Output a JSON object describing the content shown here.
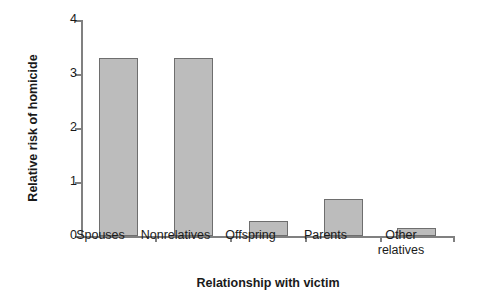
{
  "chart_data": {
    "type": "bar",
    "title": "",
    "subtitle": "",
    "xlabel": "Relationship with victim",
    "ylabel": "Relative risk of homicide",
    "categories": [
      "Spouses",
      "Nonrelatives",
      "Offspring",
      "Parents",
      "Other relatives"
    ],
    "category_lines": [
      [
        "Spouses"
      ],
      [
        "Nonrelatives"
      ],
      [
        "Offspring"
      ],
      [
        "Parents"
      ],
      [
        "Other",
        "relatives"
      ]
    ],
    "values": [
      3.3,
      3.3,
      0.28,
      0.69,
      0.14
    ],
    "ylim": [
      0,
      4
    ],
    "ytick_labels": [
      "0",
      "1",
      "2",
      "3",
      "4"
    ],
    "ytick_values": [
      0,
      1,
      2,
      3,
      4
    ],
    "grid": false,
    "legend": false,
    "legend_position": "none",
    "bar_fill_color": "#bcbcbc",
    "bar_border_color": "#6e6e6e",
    "axis_color": "#808080",
    "background_color": "#ffffff",
    "text_color": "#1a1a1a"
  }
}
